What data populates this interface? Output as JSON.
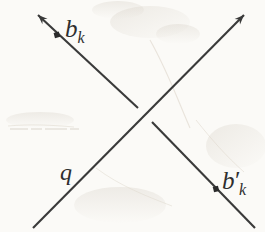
{
  "figure": {
    "background_color": "#fbfaf7",
    "ink_color": "#3a3a3a",
    "label_color": "#2e2e2e",
    "width": 265,
    "height": 232
  },
  "labels": {
    "b_k": {
      "base": "b",
      "prime": "",
      "subscript": "k"
    },
    "b_k_prime": {
      "base": "b",
      "prime": "′",
      "subscript": "k"
    },
    "q": {
      "base": "q",
      "prime": "",
      "subscript": ""
    }
  },
  "lines": [
    {
      "id": "line-bk",
      "name": "descending-arrow",
      "from": {
        "x": 255,
        "y": 228
      },
      "to": {
        "x": 35,
        "y": 12
      },
      "arrowhead_at": "to",
      "broken_at_crossing": true,
      "gap_start": {
        "x": 152,
        "y": 122
      },
      "gap_end": {
        "x": 138,
        "y": 108
      },
      "label": "b_k",
      "marker_dot": {
        "x": 57,
        "y": 35
      }
    },
    {
      "id": "line-q",
      "name": "ascending-arrow",
      "from": {
        "x": 33,
        "y": 228
      },
      "to": {
        "x": 247,
        "y": 12
      },
      "arrowhead_at": "to",
      "broken_at_crossing": false,
      "label": "q",
      "marker_dot": null
    }
  ],
  "markers": [
    {
      "id": "dot-bk",
      "name": "point-b-k",
      "x": 57,
      "y": 35
    },
    {
      "id": "dot-bkp",
      "name": "point-b-k-prime",
      "x": 216,
      "y": 189
    }
  ],
  "crossing_point": {
    "x": 145,
    "y": 115
  }
}
